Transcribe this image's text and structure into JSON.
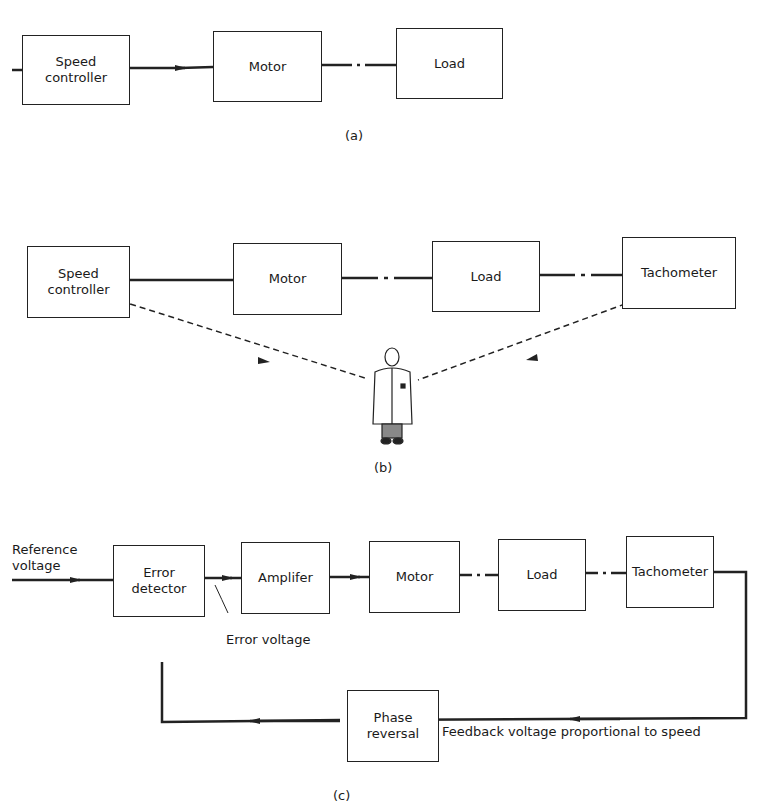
{
  "diagram_a": {
    "caption": "(a)",
    "blocks": [
      {
        "id": "speed-controller",
        "label": "Speed\ncontroller"
      },
      {
        "id": "motor",
        "label": "Motor"
      },
      {
        "id": "load",
        "label": "Load"
      }
    ]
  },
  "diagram_b": {
    "caption": "(b)",
    "blocks": [
      {
        "id": "speed-controller",
        "label": "Speed\ncontroller"
      },
      {
        "id": "motor",
        "label": "Motor"
      },
      {
        "id": "load",
        "label": "Load"
      },
      {
        "id": "tachometer",
        "label": "Tachometer"
      }
    ],
    "operator": "human-operator-figure"
  },
  "diagram_c": {
    "caption": "(c)",
    "input_label": "Reference\nvoltage",
    "blocks": [
      {
        "id": "error-detector",
        "label": "Error\ndetector"
      },
      {
        "id": "amplifier",
        "label": "Amplifer"
      },
      {
        "id": "motor",
        "label": "Motor"
      },
      {
        "id": "load",
        "label": "Load"
      },
      {
        "id": "tachometer",
        "label": "Tachometer"
      },
      {
        "id": "phase-reversal",
        "label": "Phase\nreversal"
      }
    ],
    "error_voltage_label": "Error voltage",
    "feedback_label": "Feedback voltage proportional to speed"
  }
}
